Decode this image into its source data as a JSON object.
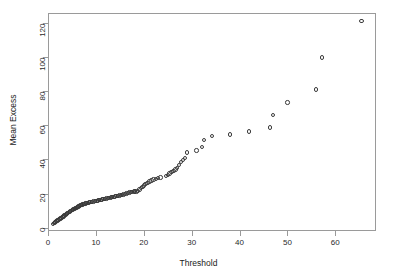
{
  "chart_data": {
    "type": "scatter",
    "title": "",
    "xlabel": "Threshold",
    "ylabel": "Mean Excess",
    "xlim": [
      0,
      68.5
    ],
    "ylim": [
      -2,
      126
    ],
    "grid": false,
    "legend": "none",
    "marker": "open-circle",
    "marker_color": "#3a3a3a",
    "xticks": [
      0,
      10,
      20,
      30,
      40,
      50,
      60
    ],
    "xticklabels": [
      "0",
      "10",
      "20",
      "30",
      "40",
      "50",
      "60"
    ],
    "yticks": [
      0,
      20,
      40,
      60,
      80,
      100,
      120
    ],
    "yticklabels": [
      "0",
      "20",
      "40",
      "60",
      "80",
      "100",
      "120"
    ],
    "x": [
      1.0,
      1.2,
      1.4,
      1.6,
      1.8,
      2.0,
      2.2,
      2.4,
      2.6,
      2.8,
      3.0,
      3.2,
      3.4,
      3.6,
      3.8,
      4.0,
      4.2,
      4.4,
      4.6,
      4.8,
      5.0,
      5.2,
      5.4,
      5.6,
      5.8,
      6.0,
      6.2,
      6.4,
      6.6,
      6.8,
      7.0,
      7.2,
      7.4,
      7.6,
      7.8,
      8.0,
      8.3,
      8.6,
      8.9,
      9.2,
      9.5,
      9.8,
      10.1,
      10.4,
      10.7,
      11.0,
      11.3,
      11.6,
      11.9,
      12.2,
      12.5,
      12.8,
      13.1,
      13.4,
      13.7,
      14.0,
      14.3,
      14.6,
      14.9,
      15.2,
      15.5,
      15.8,
      16.1,
      16.4,
      16.7,
      17.0,
      17.3,
      17.6,
      17.9,
      18.2,
      18.5,
      18.8,
      19.1,
      19.4,
      19.7,
      20.0,
      20.4,
      20.8,
      21.2,
      21.6,
      22.0,
      22.5,
      23.0,
      23.5,
      24.6,
      25.0,
      25.4,
      25.8,
      26.2,
      26.6,
      27.0,
      27.4,
      27.8,
      28.2,
      28.6,
      29.0,
      31.0,
      32.2,
      32.6,
      34.2,
      38.0,
      42.0,
      46.4,
      47.0,
      50.0,
      56.0,
      57.2,
      65.5
    ],
    "y": [
      2.2,
      2.6,
      3.0,
      3.4,
      3.8,
      4.2,
      4.6,
      5.0,
      5.4,
      5.8,
      6.2,
      6.6,
      7.0,
      7.4,
      7.8,
      8.2,
      8.6,
      9.0,
      9.4,
      9.8,
      10.2,
      10.6,
      11.0,
      11.3,
      11.6,
      11.9,
      12.2,
      12.5,
      12.8,
      13.1,
      13.3,
      13.5,
      13.7,
      13.9,
      14.1,
      14.3,
      14.5,
      14.7,
      14.9,
      15.1,
      15.3,
      15.5,
      15.7,
      15.9,
      16.1,
      16.3,
      16.5,
      16.7,
      16.9,
      17.1,
      17.3,
      17.5,
      17.7,
      17.9,
      18.1,
      18.3,
      18.5,
      18.7,
      18.9,
      19.1,
      19.3,
      19.5,
      19.8,
      20.1,
      20.4,
      20.6,
      20.8,
      21.0,
      21.2,
      21.2,
      21.3,
      21.5,
      22.4,
      23.2,
      24.0,
      24.8,
      25.6,
      26.3,
      27.0,
      27.6,
      28.2,
      28.6,
      29.3,
      29.4,
      30.2,
      31.0,
      31.8,
      32.6,
      33.4,
      34.2,
      35.0,
      36.6,
      38.4,
      39.6,
      41.0,
      44.2,
      45.2,
      47.2,
      51.4,
      53.8,
      54.6,
      56.5,
      58.8,
      66.0,
      73.4,
      81.0,
      99.8,
      121.4
    ]
  },
  "axes": {
    "xlabel": "Threshold",
    "ylabel": "Mean Excess"
  }
}
